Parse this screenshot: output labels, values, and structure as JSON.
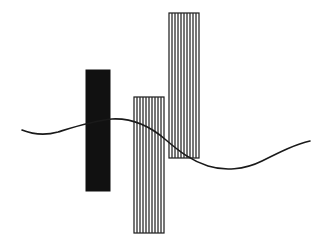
{
  "canvas": {
    "width": 326,
    "height": 251,
    "background_color": "#ffffff",
    "title": "Abstract composition of three vertical bars and a wave curve"
  },
  "palette": {
    "ink": "#1a1a1a",
    "solid_fill": "#111111",
    "hatch_stroke": "#2b2b2b",
    "outline": "#1a1a1a",
    "background": "#ffffff"
  },
  "bars": [
    {
      "id": "bar-solid-black",
      "label": "Solid black bar",
      "fill_style": "solid",
      "fill_color": "#111111",
      "x": 86,
      "y": 70,
      "width": 24,
      "height": 121,
      "stripe_count": 0,
      "stripe_spacing": 0,
      "outline_color": "#111111",
      "outline_width": 1
    },
    {
      "id": "bar-hatched-middle",
      "label": "Hatched middle bar",
      "fill_style": "vertical-stripes",
      "fill_color": "#ffffff",
      "x": 134,
      "y": 97,
      "width": 30,
      "height": 136,
      "stripe_count": 9,
      "stripe_spacing": 3.2,
      "outline_color": "#1a1a1a",
      "outline_width": 1.2
    },
    {
      "id": "bar-hatched-tall",
      "label": "Hatched tall bar",
      "fill_style": "vertical-stripes",
      "fill_color": "#ffffff",
      "x": 169,
      "y": 13,
      "width": 30,
      "height": 145,
      "stripe_count": 9,
      "stripe_spacing": 3.2,
      "outline_color": "#1a1a1a",
      "outline_width": 1.2
    }
  ],
  "wave": {
    "id": "wave-curve",
    "label": "Sine-like wave curve",
    "stroke_color": "#1a1a1a",
    "stroke_width": 1.6,
    "path": "M 22 130 C 32 134, 44 136, 58 132 C 74 127, 92 121, 112 119 C 132 118, 150 126, 166 140 C 180 152, 192 161, 208 166 C 224 171, 244 170, 262 161 C 280 152, 296 144, 310 141",
    "control_points": [
      {
        "x": 22,
        "y": 130,
        "kind": "start"
      },
      {
        "x": 42,
        "y": 135,
        "kind": "local-min"
      },
      {
        "x": 112,
        "y": 119,
        "kind": "peak"
      },
      {
        "x": 214,
        "y": 167,
        "kind": "trough"
      },
      {
        "x": 310,
        "y": 141,
        "kind": "end"
      }
    ]
  }
}
